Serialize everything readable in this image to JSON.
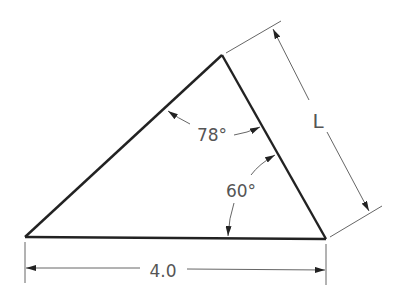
{
  "diagram": {
    "type": "triangle-dimension-drawing",
    "colors": {
      "outline": "#222222",
      "dimension": "#666666",
      "text": "#555555",
      "background": "#ffffff"
    },
    "vertices": {
      "bottom_left": [
        25,
        237
      ],
      "apex": [
        222,
        55
      ],
      "bottom_right": [
        326,
        239
      ]
    },
    "labels": {
      "angle_top": "78°",
      "angle_bottom": "60°",
      "base_length": "4.0",
      "side_length": "L"
    }
  }
}
